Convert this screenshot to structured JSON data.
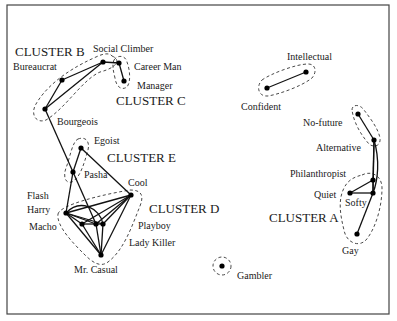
{
  "diagram": {
    "type": "cluster-network",
    "frame": {
      "x": 7,
      "y": 5,
      "w": 382,
      "h": 309
    },
    "clusters": [
      {
        "id": "A",
        "label": "CLUSTER A",
        "members": [
          "Philanthropist",
          "Quiet",
          "Softy",
          "Gay"
        ]
      },
      {
        "id": "B",
        "label": "CLUSTER B",
        "members": [
          "Bureaucrat",
          "Social Climber",
          "Bourgeois"
        ]
      },
      {
        "id": "C",
        "label": "CLUSTER C",
        "members": [
          "Career Man",
          "Manager"
        ]
      },
      {
        "id": "D",
        "label": "CLUSTER D",
        "members": [
          "Cool",
          "Flash",
          "Harry",
          "Macho",
          "Playboy",
          "Lady Killer",
          "Mr. Casual"
        ]
      },
      {
        "id": "E",
        "label": "CLUSTER E",
        "members": [
          "Egoist",
          "Pasha"
        ]
      }
    ],
    "other_groups": [
      {
        "members": [
          "Confident",
          "Intellectual"
        ]
      },
      {
        "members": [
          "No-future",
          "Alternative"
        ]
      },
      {
        "members": [
          "Gambler"
        ]
      }
    ],
    "nodes": [
      {
        "name": "Bureaucrat",
        "x": 62,
        "y": 80
      },
      {
        "name": "Social Climber",
        "x": 103,
        "y": 62
      },
      {
        "name": "Career Man",
        "x": 119,
        "y": 63
      },
      {
        "name": "Manager",
        "x": 124,
        "y": 81
      },
      {
        "name": "Bourgeois",
        "x": 45,
        "y": 109
      },
      {
        "name": "Egoist",
        "x": 81,
        "y": 148
      },
      {
        "name": "Pasha",
        "x": 73,
        "y": 172
      },
      {
        "name": "Cool",
        "x": 131,
        "y": 195
      },
      {
        "name": "Harry",
        "x": 66,
        "y": 213
      },
      {
        "name": "Flash",
        "x": 82,
        "y": 224
      },
      {
        "name": "Playboy",
        "x": 96,
        "y": 224
      },
      {
        "name": "Lady Killer",
        "x": 103,
        "y": 224
      },
      {
        "name": "Mr. Casual",
        "x": 101,
        "y": 255
      },
      {
        "name": "Intellectual",
        "x": 306,
        "y": 72
      },
      {
        "name": "Confident",
        "x": 267,
        "y": 88
      },
      {
        "name": "No-future",
        "x": 358,
        "y": 114
      },
      {
        "name": "Alternative",
        "x": 374,
        "y": 140
      },
      {
        "name": "Philanthropist",
        "x": 373,
        "y": 180
      },
      {
        "name": "Quiet",
        "x": 350,
        "y": 193
      },
      {
        "name": "Softy",
        "x": 373,
        "y": 193
      },
      {
        "name": "Gay",
        "x": 357,
        "y": 234
      },
      {
        "name": "Gambler",
        "x": 222,
        "y": 266
      }
    ],
    "node_labels": [
      {
        "text": "Social Climber",
        "x": 93,
        "y": 52
      },
      {
        "text": "Bureaucrat",
        "x": 13,
        "y": 70
      },
      {
        "text": "Career Man",
        "x": 134,
        "y": 70
      },
      {
        "text": "Manager",
        "x": 137,
        "y": 89
      },
      {
        "text": "Bourgeois",
        "x": 57,
        "y": 125
      },
      {
        "text": "Egoist",
        "x": 94,
        "y": 144
      },
      {
        "text": "Pasha",
        "x": 84,
        "y": 178
      },
      {
        "text": "Cool",
        "x": 128,
        "y": 186
      },
      {
        "text": "Flash",
        "x": 27,
        "y": 199
      },
      {
        "text": "Harry",
        "x": 27,
        "y": 213
      },
      {
        "text": "Macho",
        "x": 29,
        "y": 230
      },
      {
        "text": "Playboy",
        "x": 138,
        "y": 229
      },
      {
        "text": "Lady Killer",
        "x": 129,
        "y": 246
      },
      {
        "text": "Mr. Casual",
        "x": 74,
        "y": 273
      },
      {
        "text": "Intellectual",
        "x": 287,
        "y": 60
      },
      {
        "text": "Confident",
        "x": 241,
        "y": 110
      },
      {
        "text": "No-future",
        "x": 303,
        "y": 126
      },
      {
        "text": "Alternative",
        "x": 316,
        "y": 151
      },
      {
        "text": "Philanthropist",
        "x": 290,
        "y": 177
      },
      {
        "text": "Quiet",
        "x": 314,
        "y": 198
      },
      {
        "text": "Softy",
        "x": 345,
        "y": 206
      },
      {
        "text": "Gay",
        "x": 342,
        "y": 254
      },
      {
        "text": "Gambler",
        "x": 237,
        "y": 279
      }
    ],
    "cluster_labels": [
      {
        "text": "CLUSTER B",
        "x": 15,
        "y": 56
      },
      {
        "text": "CLUSTER C",
        "x": 116,
        "y": 105
      },
      {
        "text": "CLUSTER E",
        "x": 107,
        "y": 162
      },
      {
        "text": "CLUSTER D",
        "x": 149,
        "y": 213
      },
      {
        "text": "CLUSTER A",
        "x": 269,
        "y": 222
      }
    ],
    "edges": [
      [
        "Bureaucrat",
        "Social Climber"
      ],
      [
        "Bureaucrat",
        "Bourgeois"
      ],
      [
        "Bourgeois",
        "Social Climber"
      ],
      [
        "Social Climber",
        "Career Man"
      ],
      [
        "Career Man",
        "Manager"
      ],
      [
        "Bourgeois",
        "Pasha"
      ],
      [
        "Egoist",
        "Pasha"
      ],
      [
        "Egoist",
        "Cool"
      ],
      [
        "Pasha",
        "Harry"
      ],
      [
        "Pasha",
        "Playboy"
      ],
      [
        "Harry",
        "Cool"
      ],
      [
        "Harry",
        "Flash"
      ],
      [
        "Harry",
        "Mr. Casual"
      ],
      [
        "Harry",
        "Playboy"
      ],
      [
        "Harry",
        "Lady Killer"
      ],
      [
        "Flash",
        "Cool"
      ],
      [
        "Flash",
        "Playboy"
      ],
      [
        "Flash",
        "Mr. Casual"
      ],
      [
        "Playboy",
        "Cool"
      ],
      [
        "Playboy",
        "Lady Killer"
      ],
      [
        "Playboy",
        "Mr. Casual"
      ],
      [
        "Lady Killer",
        "Cool"
      ],
      [
        "Lady Killer",
        "Mr. Casual"
      ],
      [
        "Cool",
        "Mr. Casual"
      ],
      [
        "Confident",
        "Intellectual"
      ],
      [
        "No-future",
        "Alternative"
      ],
      [
        "Alternative",
        "Softy"
      ],
      [
        "Alternative",
        "Philanthropist"
      ],
      [
        "Philanthropist",
        "Quiet"
      ],
      [
        "Quiet",
        "Softy"
      ],
      [
        "Philanthropist",
        "Softy"
      ],
      [
        "Softy",
        "Gay"
      ]
    ]
  }
}
